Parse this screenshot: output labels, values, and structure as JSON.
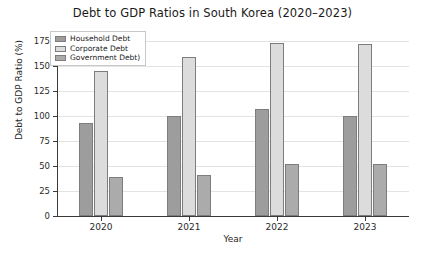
{
  "chart_data": {
    "type": "bar",
    "title": "Debt to GDP Ratios in South Korea (2020–2023)",
    "xlabel": "Year",
    "ylabel": "Debt to GDP Ratio (%)",
    "categories": [
      "2020",
      "2021",
      "2022",
      "2023"
    ],
    "ylim": [
      0,
      180
    ],
    "yticks": [
      0,
      25,
      50,
      75,
      100,
      125,
      150,
      175
    ],
    "ytick_labels": [
      "0",
      "25",
      "50",
      "75",
      "100",
      "125",
      "150",
      "175"
    ],
    "grid": true,
    "legend_position": "upper left",
    "series": [
      {
        "name": "Household Debt",
        "color": "#9d9d9d",
        "values": [
          93,
          100,
          107,
          100
        ]
      },
      {
        "name": "Corporate Debt",
        "color": "#dcdcdc",
        "values": [
          145,
          159,
          173,
          172
        ]
      },
      {
        "name": "Government Debt)",
        "color": "#ababab",
        "values": [
          39,
          41,
          52,
          52
        ]
      }
    ]
  }
}
